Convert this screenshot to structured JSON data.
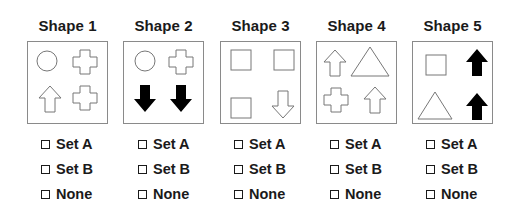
{
  "columns": [
    {
      "title": "Shape 1",
      "shapes": [
        "circle-outline",
        "cross-outline",
        "up-arrow-outline",
        "cross-outline"
      ],
      "options": [
        "Set A",
        "Set B",
        "None"
      ]
    },
    {
      "title": "Shape 2",
      "shapes": [
        "circle-outline",
        "cross-outline",
        "down-arrow-filled",
        "down-arrow-filled"
      ],
      "options": [
        "Set A",
        "Set B",
        "None"
      ]
    },
    {
      "title": "Shape 3",
      "shapes": [
        "square-outline",
        "square-outline",
        "square-outline",
        "down-arrow-outline"
      ],
      "options": [
        "Set A",
        "Set B",
        "None"
      ]
    },
    {
      "title": "Shape 4",
      "shapes": [
        "up-arrow-outline",
        "triangle-outline",
        "cross-outline",
        "up-arrow-outline"
      ],
      "options": [
        "Set A",
        "Set B",
        "None"
      ]
    },
    {
      "title": "Shape 5",
      "shapes": [
        "square-outline",
        "up-arrow-filled",
        "triangle-outline",
        "up-arrow-filled"
      ],
      "options": [
        "Set A",
        "Set B",
        "None"
      ]
    }
  ],
  "colors": {
    "border": "#8a8a8a",
    "stroke": "#777777",
    "fill": "#000000",
    "text": "#1a1a1a"
  }
}
